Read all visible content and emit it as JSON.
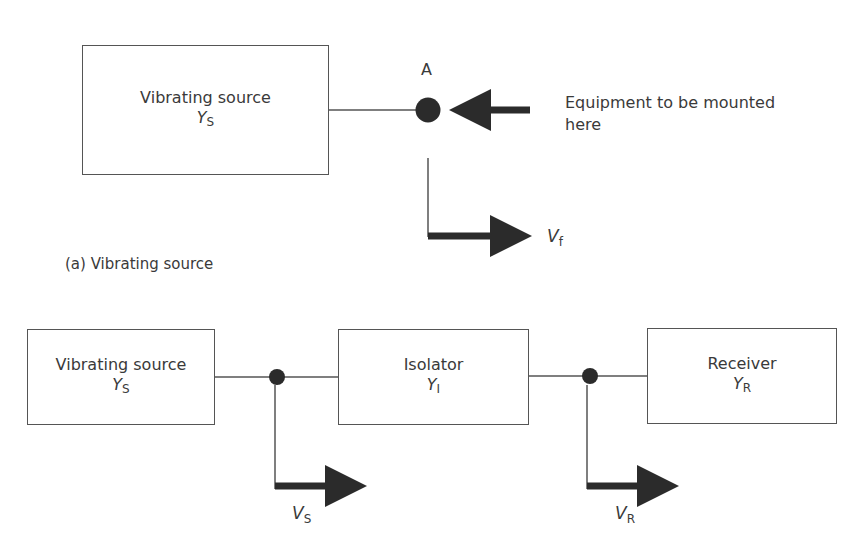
{
  "panel_a": {
    "source_box": {
      "title": "Vibrating source",
      "symbol": "Y",
      "symbol_sub": "S"
    },
    "point_label": "A",
    "equipment_note": {
      "line1": "Equipment to be mounted",
      "line2": "here"
    },
    "velocity_label": {
      "symbol": "V",
      "sub": "f"
    },
    "caption": "(a) Vibrating source"
  },
  "panel_b": {
    "source_box": {
      "title": "Vibrating source",
      "symbol": "Y",
      "symbol_sub": "S"
    },
    "isolator_box": {
      "title": "Isolator",
      "symbol": "Y",
      "symbol_sub": "I"
    },
    "receiver_box": {
      "title": "Receiver",
      "symbol": "Y",
      "symbol_sub": "R"
    },
    "velocity_source": {
      "symbol": "V",
      "sub": "S"
    },
    "velocity_receiver": {
      "symbol": "V",
      "sub": "R"
    }
  },
  "colors": {
    "line": "#555555",
    "fill": "#2b2b2b",
    "text": "#3a3a3a"
  }
}
